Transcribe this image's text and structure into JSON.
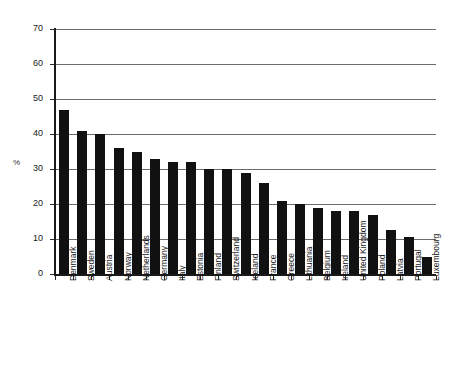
{
  "chart_data": {
    "type": "bar",
    "title": "",
    "xlabel": "",
    "ylabel": "%",
    "ylim": [
      0,
      70
    ],
    "yticks": [
      0,
      10,
      20,
      30,
      40,
      50,
      60,
      70
    ],
    "grid": true,
    "legend": false,
    "bar_color": "#111111",
    "grid_color": "#6b6b6b",
    "axis_color": "#1a1a1a",
    "categories": [
      "Denmark",
      "Sweden",
      "Austria",
      "Norway",
      "Netherlands",
      "Germany",
      "Italy",
      "Estonia",
      "Finland",
      "Switzerland",
      "Iceland",
      "France",
      "Greece",
      "Lithuania",
      "Belgium",
      "Ireland",
      "United Kingdom",
      "Poland",
      "Latvia",
      "Portugal",
      "Luxembourg"
    ],
    "values": [
      47,
      41,
      40,
      36,
      35,
      33,
      32,
      32,
      30,
      30,
      29,
      26,
      21,
      20,
      19,
      18,
      18,
      17,
      12.5,
      10.5,
      5
    ]
  }
}
